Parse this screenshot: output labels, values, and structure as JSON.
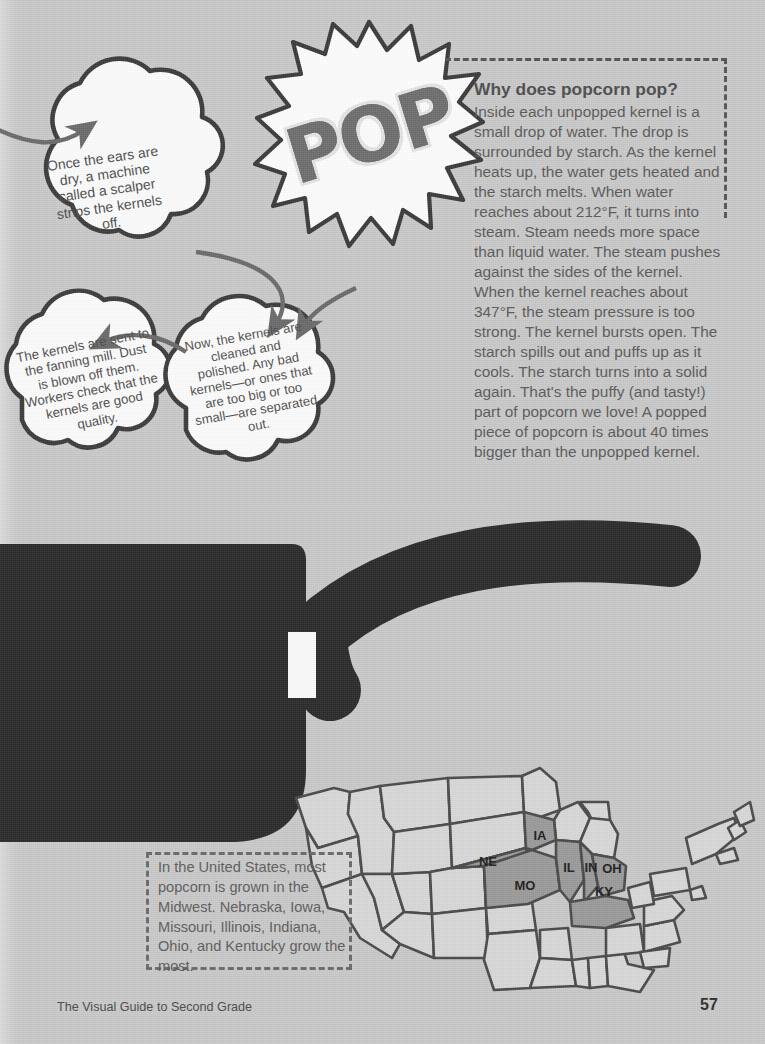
{
  "page": {
    "background_color": "#c9c9c9",
    "footer_title": "The Visual Guide to Second Grade",
    "page_number": "57"
  },
  "pop_burst": {
    "word": "POP",
    "fill_color": "#6e6e6e",
    "outline_color": "#e9e9e9",
    "burst_fill": "#fdfdfd",
    "burst_stroke": "#3b3b3b"
  },
  "why_box": {
    "title": "Why does popcorn pop?",
    "body": "Inside each unpopped kernel is a small drop of water. The drop is surrounded by starch. As the kernel heats up, the water gets heated and the starch melts. When water reaches about 212°F, it turns into steam. Steam needs more space than liquid water. The steam pushes against the sides of the kernel. When the kernel reaches about 347°F, the steam pressure is too strong. The kernel bursts open. The starch spills out and puffs up as it cools. The starch turns into a solid again. That's the puffy (and tasty!) part of popcorn we love! A popped piece of popcorn is about 40 times bigger than the unpopped kernel.",
    "border_style": "dashed",
    "border_color": "#555555",
    "text_color": "#5b5b5b"
  },
  "bubbles": [
    {
      "id": "scalper",
      "text": "Once the ears are dry, a machine called a scalper strips the kernels off.",
      "italic_word": "scalper"
    },
    {
      "id": "fanning-mill",
      "text": "The kernels are sent to the fanning mill. Dust is blown off them. Workers check that the kernels are good quality."
    },
    {
      "id": "cleaned-polished",
      "text": "Now, the kernels are cleaned and polished. Any bad kernels—or ones that are too big or too small—are separated out."
    }
  ],
  "map": {
    "caption": "In the United States, most popcorn is grown in the Midwest. Nebraska, Iowa, Missouri, Illinois, Indiana, Ohio, and Kentucky grow the most.",
    "highlight_color": "#9a9a9a",
    "state_fill": "#d6d6d6",
    "outline_color": "#4a4a4a",
    "highlighted_states": [
      {
        "abbr": "NE",
        "name": "Nebraska"
      },
      {
        "abbr": "IA",
        "name": "Iowa"
      },
      {
        "abbr": "MO",
        "name": "Missouri"
      },
      {
        "abbr": "IL",
        "name": "Illinois"
      },
      {
        "abbr": "IN",
        "name": "Indiana"
      },
      {
        "abbr": "OH",
        "name": "Ohio"
      },
      {
        "abbr": "KY",
        "name": "Kentucky"
      }
    ]
  },
  "pot": {
    "color": "#2b2b2b",
    "label": "popcorn-pot-illustration"
  }
}
